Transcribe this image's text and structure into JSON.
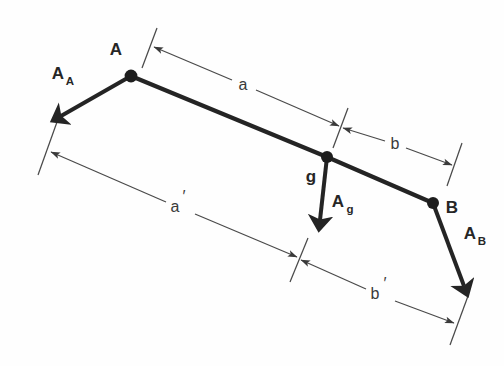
{
  "figure": {
    "type": "engineering-vector-diagram",
    "background_color": "#fefefe",
    "ink_color": "#242424",
    "dimension_color": "#4a4a4a"
  },
  "labels": {
    "node_a": "A",
    "node_g": "g",
    "node_b": "B",
    "force_a_base": "A",
    "force_a_sub": "A",
    "force_g_base": "A",
    "force_g_sub": "g",
    "force_b_base": "A",
    "force_b_sub": "B",
    "dim_a": "a",
    "dim_b": "b",
    "dim_a_prime_base": "a",
    "dim_a_prime_mark": "′",
    "dim_b_prime_base": "b",
    "dim_b_prime_mark": "′"
  },
  "geometry": {
    "beam_points": "131,76 327,157 433,203",
    "force_a_shaft": "131,76 60,116",
    "force_a_tip": "52,120",
    "force_g_shaft": "327,157 320,220",
    "force_g_tip": "318,231",
    "force_b_shaft": "433,203 465,288",
    "force_b_tip": "470,300",
    "nodes": [
      {
        "name": "A",
        "cx": 131,
        "cy": 76,
        "r": 6.2
      },
      {
        "name": "g",
        "cx": 327,
        "cy": 157,
        "r": 5.8
      },
      {
        "name": "B",
        "cx": 433,
        "cy": 203,
        "r": 5.8
      }
    ],
    "dim_a": {
      "from": "152,48",
      "to": "341,127",
      "label_x": 243,
      "label_y": 86
    },
    "dim_b": {
      "from": "341,127",
      "to": "453,166",
      "label_x": 395,
      "label_y": 145
    },
    "dim_a_prime": {
      "from": "49,152",
      "to": "298,258",
      "label_x": 181,
      "label_y": 208
    },
    "dim_b_prime": {
      "from": "300,259",
      "to": "455,323",
      "label_x": 381,
      "label_y": 294
    },
    "ext_ticks": [
      {
        "name": "tick-a-left",
        "from": "157,28",
        "to": "142,68"
      },
      {
        "name": "tick-a-right",
        "from": "348,108",
        "to": "333,148"
      },
      {
        "name": "tick-b-right",
        "from": "462,143",
        "to": "447,186"
      },
      {
        "name": "tick-aprime-left",
        "from": "57,122",
        "to": "38,175"
      },
      {
        "name": "tick-aprime-right",
        "from": "308,238",
        "to": "290,282"
      },
      {
        "name": "tick-bprime-right",
        "from": "468,296",
        "to": "450,345"
      }
    ],
    "label_positions": {
      "node_a": {
        "x": 116,
        "y": 51
      },
      "node_g": {
        "x": 311,
        "y": 177
      },
      "node_b": {
        "x": 451,
        "y": 208
      },
      "force_a": {
        "x": 62,
        "y": 75
      },
      "force_g": {
        "x": 336,
        "y": 204
      },
      "force_b": {
        "x": 469,
        "y": 237
      }
    }
  }
}
